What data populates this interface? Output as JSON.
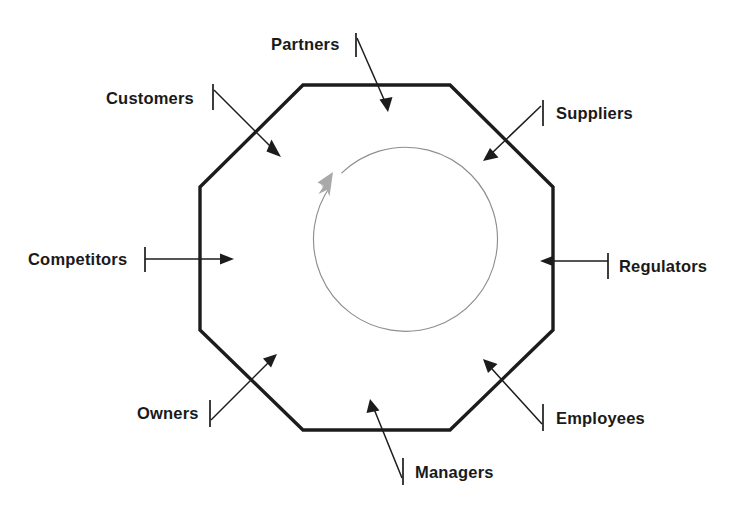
{
  "diagram": {
    "background_color": "#ffffff",
    "shape": {
      "name": "octagon",
      "stroke_color": "#1c1c1c",
      "fill_color": "#ffffff"
    },
    "center_cycle": {
      "name": "clockwise-cycle-arc",
      "stroke_color": "#8f8f8f",
      "arrowhead_color": "#a9a9a9",
      "direction": "clockwise"
    },
    "label_color": "#1a1a1a",
    "stakeholders": [
      {
        "id": "partners",
        "label": "Partners",
        "position": "top",
        "tick_side": "right",
        "arrow_direction": "down-right-inward"
      },
      {
        "id": "customers",
        "label": "Customers",
        "position": "top-left",
        "tick_side": "right",
        "arrow_direction": "down-right-inward"
      },
      {
        "id": "suppliers",
        "label": "Suppliers",
        "position": "top-right",
        "tick_side": "left",
        "arrow_direction": "down-left-inward"
      },
      {
        "id": "competitors",
        "label": "Competitors",
        "position": "left",
        "tick_side": "right",
        "arrow_direction": "right-inward"
      },
      {
        "id": "regulators",
        "label": "Regulators",
        "position": "right",
        "tick_side": "left",
        "arrow_direction": "left-inward"
      },
      {
        "id": "owners",
        "label": "Owners",
        "position": "bottom-left",
        "tick_side": "right",
        "arrow_direction": "up-right-inward"
      },
      {
        "id": "employees",
        "label": "Employees",
        "position": "bottom-right",
        "tick_side": "left",
        "arrow_direction": "up-left-inward"
      },
      {
        "id": "managers",
        "label": "Managers",
        "position": "bottom",
        "tick_side": "left",
        "arrow_direction": "up-left-inward"
      }
    ]
  }
}
